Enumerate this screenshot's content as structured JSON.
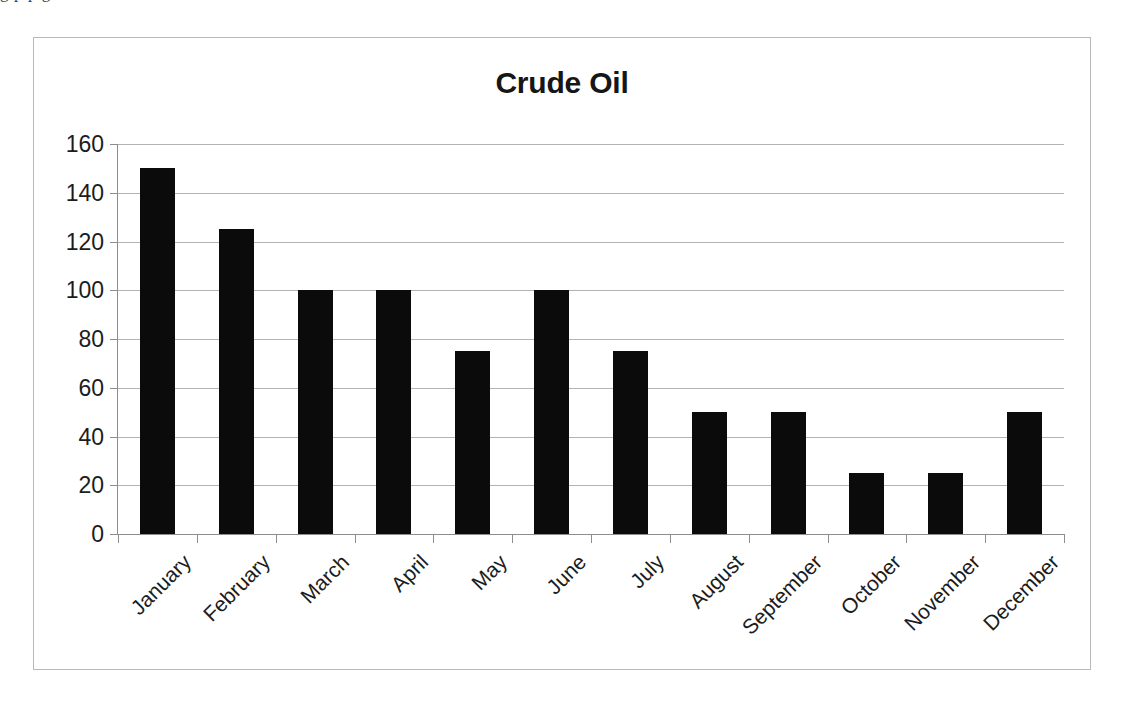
{
  "page": {
    "top_text_remnant": "g p       p                                 g"
  },
  "chart_data": {
    "type": "bar",
    "title": "Crude Oil",
    "xlabel": "",
    "ylabel": "",
    "categories": [
      "January",
      "February",
      "March",
      "April",
      "May",
      "June",
      "July",
      "August",
      "September",
      "October",
      "November",
      "December"
    ],
    "values": [
      150,
      125,
      100,
      100,
      75,
      100,
      75,
      50,
      50,
      25,
      25,
      50
    ],
    "series": [
      {
        "name": "Crude Oil",
        "values": [
          150,
          125,
          100,
          100,
          75,
          100,
          75,
          50,
          50,
          25,
          25,
          50
        ]
      }
    ],
    "ylim": [
      0,
      160
    ],
    "yticks": [
      0,
      20,
      40,
      60,
      80,
      100,
      120,
      140,
      160
    ],
    "ytick_labels": [
      "0",
      "20",
      "40",
      "60",
      "80",
      "100",
      "120",
      "140",
      "160"
    ],
    "grid": true,
    "legend": false,
    "legend_position": "none",
    "bar_color": "#0b0b0b",
    "gridline_color": "#9a9a9a",
    "axis_color": "#8d8d8d",
    "frame_color": "#b9b9bd",
    "background_color": "#ffffff",
    "xtick_label_rotation": -45
  }
}
